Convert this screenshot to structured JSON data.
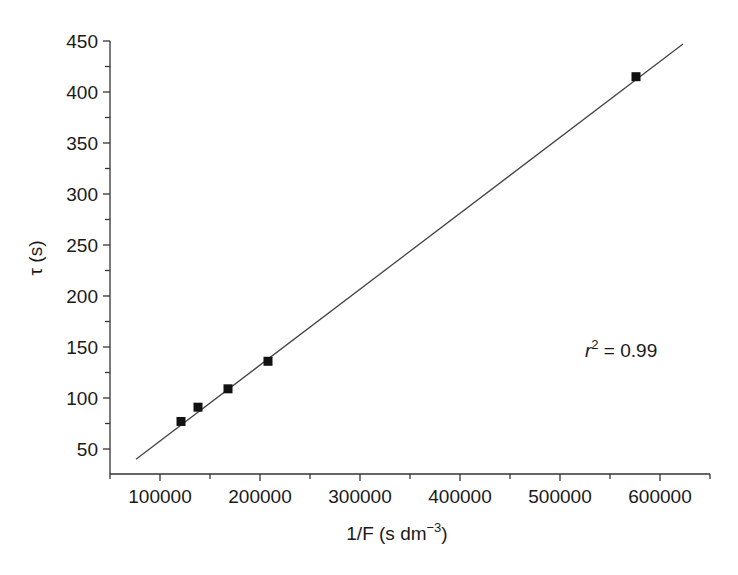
{
  "chart_data": {
    "type": "scatter",
    "title": "",
    "xlabel": "1/F  (s dm−3)",
    "xlabel_parts": {
      "main": "1/F  (s dm",
      "sup": "−3",
      "end": ")"
    },
    "ylabel": "τ (s)",
    "xlim": [
      50000,
      650000
    ],
    "ylim": [
      25,
      450
    ],
    "x_ticks": [
      100000,
      200000,
      300000,
      400000,
      500000,
      600000
    ],
    "x_tick_labels": [
      "100000",
      "200000",
      "300000",
      "400000",
      "500000",
      "600000"
    ],
    "x_minor_ticks": [
      50000,
      150000,
      250000,
      350000,
      450000,
      550000,
      650000
    ],
    "y_ticks": [
      50,
      100,
      150,
      200,
      250,
      300,
      350,
      400,
      450
    ],
    "y_tick_labels": [
      "50",
      "100",
      "150",
      "200",
      "250",
      "300",
      "350",
      "400",
      "450"
    ],
    "y_minor_ticks": [
      75,
      125,
      175,
      225,
      275,
      325,
      375,
      425
    ],
    "grid": false,
    "legend": null,
    "series": [
      {
        "name": "data",
        "marker": "square",
        "x": [
          121000,
          138000,
          168000,
          208000,
          576000
        ],
        "y": [
          77,
          91,
          109,
          136,
          415
        ]
      },
      {
        "name": "linear fit",
        "type": "line",
        "x": [
          76000,
          623000
        ],
        "y": [
          40,
          447
        ]
      }
    ],
    "annotations": [
      {
        "text": "r2 = 0.99",
        "x": 560000,
        "y": 97
      }
    ]
  },
  "annotation": {
    "r": "r",
    "sup": "2",
    "rest": " = 0.99"
  }
}
